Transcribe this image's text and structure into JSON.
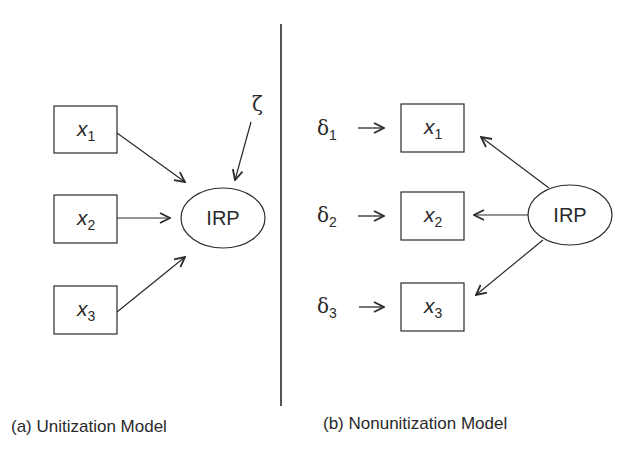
{
  "panels": {
    "a": {
      "caption": "(a) Unitization Model",
      "latent": "IRP",
      "disturbance": "ζ",
      "indicators": [
        {
          "var": "x",
          "sub": "1"
        },
        {
          "var": "x",
          "sub": "2"
        },
        {
          "var": "x",
          "sub": "3"
        }
      ]
    },
    "b": {
      "caption": "(b) Nonunitization Model",
      "latent": "IRP",
      "indicators": [
        {
          "var": "x",
          "sub": "1",
          "error": "δ",
          "error_sub": "1"
        },
        {
          "var": "x",
          "sub": "2",
          "error": "δ",
          "error_sub": "2"
        },
        {
          "var": "x",
          "sub": "3",
          "error": "δ",
          "error_sub": "3"
        }
      ]
    }
  },
  "colors": {
    "stroke": "#2a2a2a",
    "background": "#ffffff"
  }
}
